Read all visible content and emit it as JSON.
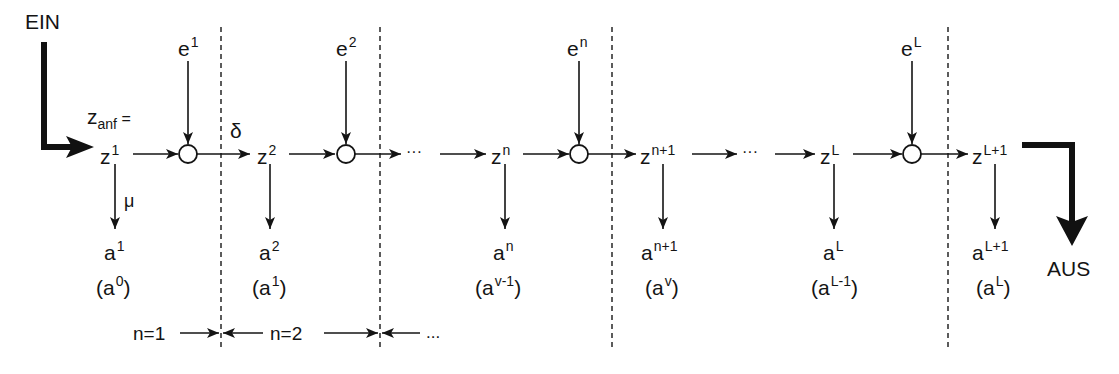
{
  "diagram": {
    "type": "multistage decision process flow",
    "input_label": "EIN",
    "output_label": "AUS",
    "initial_state": {
      "base": "z",
      "sub": "anf",
      "suffix": " ="
    },
    "transition_label": "δ",
    "output_function_label": "μ",
    "ellipsis": "···",
    "states": [
      {
        "id": "z1",
        "base": "z",
        "sup": "1"
      },
      {
        "id": "z2",
        "base": "z",
        "sup": "2"
      },
      {
        "id": "zn",
        "base": "z",
        "sup": "n"
      },
      {
        "id": "zn1",
        "base": "z",
        "sup": "n+1"
      },
      {
        "id": "zL",
        "base": "z",
        "sup": "L"
      },
      {
        "id": "zL1",
        "base": "z",
        "sup": "L+1"
      }
    ],
    "inputs": [
      {
        "id": "e1",
        "base": "e",
        "sup": "1"
      },
      {
        "id": "e2",
        "base": "e",
        "sup": "2"
      },
      {
        "id": "en",
        "base": "e",
        "sup": "n"
      },
      {
        "id": "eL",
        "base": "e",
        "sup": "L"
      }
    ],
    "outputs": [
      {
        "id": "a1",
        "base": "a",
        "sup": "1",
        "alt_base": "a",
        "alt_sup": "0"
      },
      {
        "id": "a2",
        "base": "a",
        "sup": "2",
        "alt_base": "a",
        "alt_sup": "1"
      },
      {
        "id": "an",
        "base": "a",
        "sup": "n",
        "alt_base": "a",
        "alt_sup": "v-1"
      },
      {
        "id": "an1",
        "base": "a",
        "sup": "n+1",
        "alt_base": "a",
        "alt_sup": "v"
      },
      {
        "id": "aL",
        "base": "a",
        "sup": "L",
        "alt_base": "a",
        "alt_sup": "L-1"
      },
      {
        "id": "aL1",
        "base": "a",
        "sup": "L+1",
        "alt_base": "a",
        "alt_sup": "L"
      }
    ],
    "stages": [
      {
        "label": "n=1"
      },
      {
        "label": "n=2"
      },
      {
        "label": "..."
      }
    ],
    "colors": {
      "ink": "#141414",
      "dashed": "#333333",
      "background": "#ffffff"
    }
  }
}
